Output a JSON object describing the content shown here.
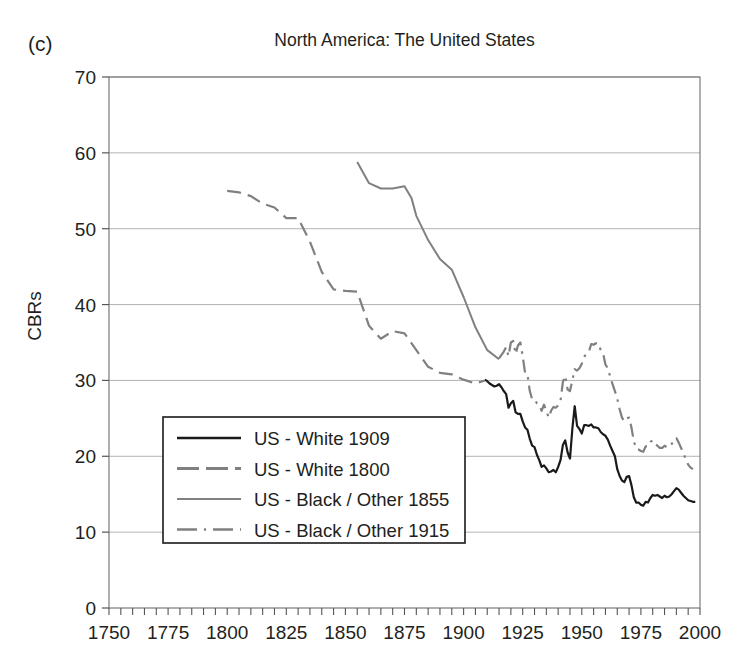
{
  "panel_label": "(c)",
  "title": "North America: The United States",
  "ylabel": "CBRs",
  "chart_data": {
    "type": "line",
    "title": "North America: The United States",
    "panel_label": "(c)",
    "xlabel": "",
    "ylabel": "CBRs",
    "xlim": [
      1750,
      2000
    ],
    "ylim": [
      0,
      70
    ],
    "xticks": [
      1750,
      1775,
      1800,
      1825,
      1850,
      1875,
      1900,
      1925,
      1950,
      1975,
      2000
    ],
    "yticks": [
      0,
      10,
      20,
      30,
      40,
      50,
      60,
      70
    ],
    "x_minor_tick_step": 5,
    "grid": "horizontal",
    "grid_color": "#b3b3b3",
    "legend_position": "lower-left-inside",
    "series": [
      {
        "name": "US - White 1909",
        "style": "solid",
        "color": "#1a1a1a",
        "width": 2.2,
        "points": [
          [
            1909,
            30.1
          ],
          [
            1910,
            29.9
          ],
          [
            1911,
            29.6
          ],
          [
            1912,
            29.4
          ],
          [
            1913,
            29.2
          ],
          [
            1914,
            29.3
          ],
          [
            1915,
            29.5
          ],
          [
            1916,
            29.1
          ],
          [
            1917,
            28.6
          ],
          [
            1918,
            28.2
          ],
          [
            1919,
            26.4
          ],
          [
            1920,
            27.0
          ],
          [
            1921,
            27.3
          ],
          [
            1922,
            25.8
          ],
          [
            1923,
            25.6
          ],
          [
            1924,
            25.6
          ],
          [
            1925,
            24.6
          ],
          [
            1926,
            23.8
          ],
          [
            1927,
            23.5
          ],
          [
            1928,
            22.3
          ],
          [
            1929,
            21.4
          ],
          [
            1930,
            21.2
          ],
          [
            1931,
            20.2
          ],
          [
            1932,
            19.5
          ],
          [
            1933,
            18.6
          ],
          [
            1934,
            18.8
          ],
          [
            1935,
            18.4
          ],
          [
            1936,
            17.9
          ],
          [
            1937,
            18.0
          ],
          [
            1938,
            18.2
          ],
          [
            1939,
            17.9
          ],
          [
            1940,
            18.6
          ],
          [
            1941,
            19.5
          ],
          [
            1942,
            21.5
          ],
          [
            1943,
            22.1
          ],
          [
            1944,
            20.5
          ],
          [
            1945,
            19.7
          ],
          [
            1946,
            23.6
          ],
          [
            1947,
            26.6
          ],
          [
            1948,
            24.0
          ],
          [
            1949,
            23.6
          ],
          [
            1950,
            23.0
          ],
          [
            1951,
            24.1
          ],
          [
            1952,
            24.1
          ],
          [
            1953,
            24.0
          ],
          [
            1954,
            24.2
          ],
          [
            1955,
            23.8
          ],
          [
            1956,
            23.8
          ],
          [
            1957,
            23.7
          ],
          [
            1958,
            23.2
          ],
          [
            1959,
            22.9
          ],
          [
            1960,
            22.7
          ],
          [
            1961,
            22.2
          ],
          [
            1962,
            21.4
          ],
          [
            1963,
            20.7
          ],
          [
            1964,
            20.0
          ],
          [
            1965,
            18.3
          ],
          [
            1966,
            17.4
          ],
          [
            1967,
            16.8
          ],
          [
            1968,
            16.6
          ],
          [
            1969,
            17.3
          ],
          [
            1970,
            17.4
          ],
          [
            1971,
            16.2
          ],
          [
            1972,
            14.6
          ],
          [
            1973,
            13.9
          ],
          [
            1974,
            13.9
          ],
          [
            1975,
            13.6
          ],
          [
            1976,
            13.5
          ],
          [
            1977,
            14.0
          ],
          [
            1978,
            13.9
          ],
          [
            1979,
            14.5
          ],
          [
            1980,
            14.9
          ],
          [
            1981,
            14.8
          ],
          [
            1982,
            14.9
          ],
          [
            1983,
            14.7
          ],
          [
            1984,
            14.5
          ],
          [
            1985,
            14.8
          ],
          [
            1986,
            14.6
          ],
          [
            1987,
            14.7
          ],
          [
            1988,
            15.0
          ],
          [
            1989,
            15.4
          ],
          [
            1990,
            15.8
          ],
          [
            1991,
            15.6
          ],
          [
            1992,
            15.2
          ],
          [
            1993,
            14.8
          ],
          [
            1994,
            14.5
          ],
          [
            1995,
            14.2
          ],
          [
            1996,
            14.1
          ],
          [
            1997,
            14.0
          ],
          [
            1998,
            14.0
          ]
        ]
      },
      {
        "name": "US - White 1800",
        "style": "dashed",
        "color": "#808080",
        "width": 2.2,
        "dash": "14,7",
        "points": [
          [
            1800,
            55.0
          ],
          [
            1805,
            54.8
          ],
          [
            1810,
            54.3
          ],
          [
            1815,
            53.3
          ],
          [
            1820,
            52.8
          ],
          [
            1825,
            51.4
          ],
          [
            1830,
            51.4
          ],
          [
            1835,
            48.3
          ],
          [
            1840,
            44.3
          ],
          [
            1845,
            42.0
          ],
          [
            1850,
            41.8
          ],
          [
            1855,
            41.7
          ],
          [
            1860,
            37.2
          ],
          [
            1865,
            35.5
          ],
          [
            1870,
            36.5
          ],
          [
            1875,
            36.2
          ],
          [
            1880,
            34.0
          ],
          [
            1885,
            31.8
          ],
          [
            1890,
            31.0
          ],
          [
            1895,
            30.8
          ],
          [
            1900,
            30.1
          ],
          [
            1905,
            29.6
          ],
          [
            1909,
            30.0
          ]
        ]
      },
      {
        "name": "US - Black / Other 1855",
        "style": "solid",
        "color": "#808080",
        "width": 2.0,
        "points": [
          [
            1855,
            58.8
          ],
          [
            1860,
            56.0
          ],
          [
            1865,
            55.3
          ],
          [
            1870,
            55.3
          ],
          [
            1875,
            55.6
          ],
          [
            1878,
            54.0
          ],
          [
            1880,
            51.7
          ],
          [
            1885,
            48.5
          ],
          [
            1890,
            46.0
          ],
          [
            1895,
            44.6
          ],
          [
            1900,
            41.0
          ],
          [
            1905,
            37.0
          ],
          [
            1910,
            34.0
          ],
          [
            1915,
            32.8
          ]
        ]
      },
      {
        "name": "US - Black / Other 1915",
        "style": "dash-dot",
        "color": "#808080",
        "width": 2.2,
        "dash": "13,6,2.5,6",
        "points": [
          [
            1915,
            32.9
          ],
          [
            1917,
            33.8
          ],
          [
            1918,
            34.4
          ],
          [
            1919,
            33.2
          ],
          [
            1920,
            35.0
          ],
          [
            1921,
            35.2
          ],
          [
            1922,
            33.5
          ],
          [
            1923,
            34.6
          ],
          [
            1924,
            35.0
          ],
          [
            1925,
            33.2
          ],
          [
            1926,
            31.0
          ],
          [
            1927,
            30.8
          ],
          [
            1928,
            28.6
          ],
          [
            1929,
            27.5
          ],
          [
            1930,
            27.5
          ],
          [
            1931,
            27.0
          ],
          [
            1932,
            26.8
          ],
          [
            1933,
            26.0
          ],
          [
            1934,
            26.8
          ],
          [
            1935,
            26.0
          ],
          [
            1936,
            25.1
          ],
          [
            1937,
            26.0
          ],
          [
            1938,
            26.5
          ],
          [
            1939,
            26.4
          ],
          [
            1940,
            26.7
          ],
          [
            1941,
            27.3
          ],
          [
            1942,
            29.8
          ],
          [
            1943,
            30.6
          ],
          [
            1944,
            28.8
          ],
          [
            1945,
            28.6
          ],
          [
            1946,
            30.0
          ],
          [
            1947,
            31.5
          ],
          [
            1948,
            31.3
          ],
          [
            1949,
            31.6
          ],
          [
            1950,
            32.2
          ],
          [
            1951,
            33.1
          ],
          [
            1952,
            33.6
          ],
          [
            1953,
            33.8
          ],
          [
            1954,
            34.8
          ],
          [
            1955,
            34.7
          ],
          [
            1956,
            34.9
          ],
          [
            1957,
            34.9
          ],
          [
            1958,
            34.0
          ],
          [
            1959,
            33.6
          ],
          [
            1960,
            32.1
          ],
          [
            1961,
            31.6
          ],
          [
            1962,
            30.5
          ],
          [
            1963,
            29.5
          ],
          [
            1964,
            28.6
          ],
          [
            1965,
            27.6
          ],
          [
            1966,
            26.2
          ],
          [
            1967,
            25.1
          ],
          [
            1968,
            24.6
          ],
          [
            1969,
            25.0
          ],
          [
            1970,
            25.1
          ],
          [
            1971,
            23.8
          ],
          [
            1972,
            22.0
          ],
          [
            1973,
            21.0
          ],
          [
            1974,
            20.9
          ],
          [
            1975,
            20.7
          ],
          [
            1976,
            20.6
          ],
          [
            1977,
            21.3
          ],
          [
            1978,
            21.3
          ],
          [
            1979,
            21.9
          ],
          [
            1980,
            22.1
          ],
          [
            1981,
            21.6
          ],
          [
            1982,
            21.4
          ],
          [
            1983,
            21.1
          ],
          [
            1984,
            21.1
          ],
          [
            1985,
            21.4
          ],
          [
            1986,
            21.2
          ],
          [
            1987,
            21.2
          ],
          [
            1988,
            21.6
          ],
          [
            1989,
            22.2
          ],
          [
            1990,
            22.4
          ],
          [
            1991,
            21.8
          ],
          [
            1992,
            21.1
          ],
          [
            1993,
            20.4
          ],
          [
            1994,
            19.6
          ],
          [
            1995,
            18.9
          ],
          [
            1996,
            18.5
          ],
          [
            1997,
            18.3
          ]
        ]
      }
    ]
  },
  "legend": {
    "items": [
      {
        "label": "US - White 1909",
        "style": "solid",
        "color": "#1a1a1a",
        "width": 2.6,
        "dash": ""
      },
      {
        "label": "US - White 1800",
        "style": "dashed",
        "color": "#808080",
        "width": 3.0,
        "dash": "22,7"
      },
      {
        "label": "US - Black / Other 1855",
        "style": "solid",
        "color": "#808080",
        "width": 1.8,
        "dash": ""
      },
      {
        "label": "US - Black / Other 1915",
        "style": "dash-dot",
        "color": "#808080",
        "width": 2.6,
        "dash": "20,7,2,7"
      }
    ]
  }
}
